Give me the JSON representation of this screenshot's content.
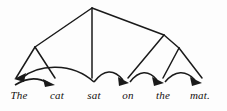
{
  "figure": {
    "sentence": "The cat sat on the mat.",
    "background_color": "#fdfdfd",
    "ink_color": "#1a1a1a"
  },
  "words": [
    {
      "id": "w1",
      "text": "The",
      "x": 19,
      "y": 96
    },
    {
      "id": "w2",
      "text": "cat",
      "x": 57,
      "y": 96
    },
    {
      "id": "w3",
      "text": "sat",
      "x": 94,
      "y": 96
    },
    {
      "id": "w4",
      "text": "on",
      "x": 128,
      "y": 96
    },
    {
      "id": "w5",
      "text": "the",
      "x": 163,
      "y": 96
    },
    {
      "id": "w6",
      "text": "mat.",
      "x": 200,
      "y": 96
    }
  ],
  "tree": {
    "nodes": [
      {
        "id": "root",
        "label": "root-node",
        "x": 92,
        "y": 8
      },
      {
        "id": "np",
        "label": "left-phrase-node",
        "x": 35,
        "y": 47
      },
      {
        "id": "pp",
        "label": "right-phrase-node",
        "x": 164,
        "y": 35
      },
      {
        "id": "npr",
        "label": "right-inner-node",
        "x": 179,
        "y": 48
      }
    ],
    "edges": [
      {
        "id": "e1",
        "from": "root",
        "to": "np",
        "x1": 92,
        "y1": 8,
        "x2": 35,
        "y2": 47
      },
      {
        "id": "e2",
        "from": "root",
        "to": "w3",
        "x1": 92,
        "y1": 8,
        "x2": 92,
        "y2": 78
      },
      {
        "id": "e3",
        "from": "root",
        "to": "pp",
        "x1": 92,
        "y1": 8,
        "x2": 164,
        "y2": 35
      },
      {
        "id": "e4",
        "from": "np",
        "to": "w1",
        "x1": 35,
        "y1": 47,
        "x2": 16,
        "y2": 78
      },
      {
        "id": "e5",
        "from": "np",
        "to": "w2",
        "x1": 35,
        "y1": 47,
        "x2": 55,
        "y2": 78
      },
      {
        "id": "e6",
        "from": "pp",
        "to": "w4",
        "x1": 164,
        "y1": 35,
        "x2": 128,
        "y2": 78
      },
      {
        "id": "e7",
        "from": "pp",
        "to": "npr",
        "x1": 164,
        "y1": 35,
        "x2": 179,
        "y2": 48
      },
      {
        "id": "e8",
        "from": "npr",
        "to": "w5",
        "x1": 179,
        "y1": 48,
        "x2": 163,
        "y2": 78
      },
      {
        "id": "e9",
        "from": "npr",
        "to": "w6",
        "x1": 179,
        "y1": 48,
        "x2": 202,
        "y2": 78
      }
    ]
  },
  "arcs": [
    {
      "id": "a1",
      "label": "arc-sat-to-the",
      "from": "w3",
      "to": "w1",
      "direction": "left",
      "x1": 94,
      "y1": 82,
      "x2": 19,
      "y2": 80,
      "peak_y": 67
    },
    {
      "id": "a2",
      "label": "arc-the-to-cat",
      "from": "w1",
      "to": "w2",
      "direction": "right",
      "x1": 16,
      "y1": 85,
      "x2": 52,
      "y2": 84,
      "peak_y": 78
    },
    {
      "id": "a3",
      "label": "arc-sat-to-on",
      "from": "w3",
      "to": "w4",
      "direction": "right",
      "x1": 94,
      "y1": 82,
      "x2": 127,
      "y2": 81,
      "peak_y": 72
    },
    {
      "id": "a4",
      "label": "arc-on-to-the",
      "from": "w4",
      "to": "w5",
      "direction": "right",
      "x1": 130,
      "y1": 82,
      "x2": 161,
      "y2": 81,
      "peak_y": 72
    },
    {
      "id": "a5",
      "label": "arc-the-to-mat",
      "from": "w5",
      "to": "w6",
      "direction": "right",
      "x1": 165,
      "y1": 82,
      "x2": 199,
      "y2": 81,
      "peak_y": 72
    }
  ]
}
